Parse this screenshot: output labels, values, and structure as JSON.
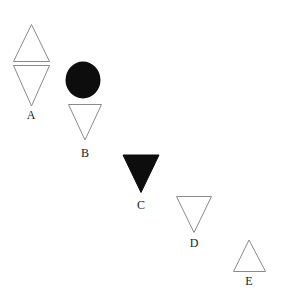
{
  "figure": {
    "background_color": "#ffffff",
    "outline_color": "#8a8a8a",
    "fill_color": "#0d0d0d",
    "label_color": "#1a1a1a",
    "width": 282,
    "height": 299,
    "groups": [
      {
        "label": "A",
        "icon_name": "double-triangle-outline",
        "description": "outlined upward triangle above outlined downward triangle",
        "shapes": [
          {
            "kind": "triangle-up",
            "fill": "none",
            "stroke": "#8a8a8a"
          },
          {
            "kind": "triangle-down",
            "fill": "none",
            "stroke": "#8a8a8a"
          }
        ]
      },
      {
        "label": "B",
        "icon_name": "circle-filled-over-triangle-outline",
        "description": "filled black circle above outlined downward triangle",
        "shapes": [
          {
            "kind": "circle",
            "fill": "#0d0d0d",
            "stroke": "none"
          },
          {
            "kind": "triangle-down",
            "fill": "none",
            "stroke": "#8a8a8a"
          }
        ]
      },
      {
        "label": "C",
        "icon_name": "triangle-down-filled",
        "description": "filled black downward triangle",
        "shapes": [
          {
            "kind": "triangle-down",
            "fill": "#0d0d0d",
            "stroke": "none"
          }
        ]
      },
      {
        "label": "D",
        "icon_name": "triangle-down-outline",
        "description": "outlined downward triangle",
        "shapes": [
          {
            "kind": "triangle-down",
            "fill": "none",
            "stroke": "#8a8a8a"
          }
        ]
      },
      {
        "label": "E",
        "icon_name": "triangle-up-outline",
        "description": "outlined upward triangle",
        "shapes": [
          {
            "kind": "triangle-up",
            "fill": "none",
            "stroke": "#8a8a8a"
          }
        ]
      }
    ]
  }
}
